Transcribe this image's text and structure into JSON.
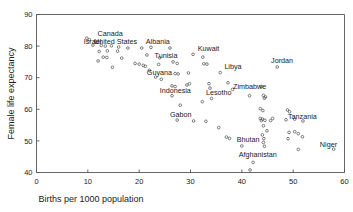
{
  "chart_data": {
    "type": "scatter",
    "title": "",
    "xlabel": "Births per 1000 population",
    "ylabel": "Female life expectancy",
    "xlim": [
      0,
      60
    ],
    "ylim": [
      40,
      90
    ],
    "xticks": [
      0,
      10,
      20,
      30,
      40,
      50,
      60
    ],
    "yticks": [
      40,
      50,
      60,
      70,
      80,
      90
    ],
    "grid": false,
    "legend": "none",
    "marker": "open-circle",
    "marker_color": "#555555",
    "points": [
      {
        "x": 9.8,
        "y": 82.5,
        "label": ""
      },
      {
        "x": 10.3,
        "y": 82.0,
        "label": ""
      },
      {
        "x": 11.5,
        "y": 81.5,
        "label": "Canada"
      },
      {
        "x": 11.0,
        "y": 80.3,
        "label": "Israel"
      },
      {
        "x": 12.6,
        "y": 80.2,
        "label": "United States"
      },
      {
        "x": 13.4,
        "y": 80.0,
        "label": ""
      },
      {
        "x": 14.6,
        "y": 80.1,
        "label": ""
      },
      {
        "x": 16.0,
        "y": 79.7,
        "label": ""
      },
      {
        "x": 17.8,
        "y": 79.4,
        "label": ""
      },
      {
        "x": 12.2,
        "y": 78.3,
        "label": ""
      },
      {
        "x": 13.8,
        "y": 78.5,
        "label": ""
      },
      {
        "x": 15.8,
        "y": 78.4,
        "label": ""
      },
      {
        "x": 12.0,
        "y": 75.3,
        "label": ""
      },
      {
        "x": 13.0,
        "y": 76.5,
        "label": ""
      },
      {
        "x": 13.7,
        "y": 76.4,
        "label": ""
      },
      {
        "x": 16.6,
        "y": 76.2,
        "label": ""
      },
      {
        "x": 14.8,
        "y": 73.3,
        "label": ""
      },
      {
        "x": 19.2,
        "y": 74.5,
        "label": ""
      },
      {
        "x": 20.0,
        "y": 74.3,
        "label": ""
      },
      {
        "x": 20.8,
        "y": 73.9,
        "label": ""
      },
      {
        "x": 21.2,
        "y": 73.6,
        "label": ""
      },
      {
        "x": 20.5,
        "y": 79.4,
        "label": "Albania"
      },
      {
        "x": 22.3,
        "y": 79.6,
        "label": ""
      },
      {
        "x": 21.5,
        "y": 77.2,
        "label": ""
      },
      {
        "x": 23.8,
        "y": 74.2,
        "label": ""
      },
      {
        "x": 24.0,
        "y": 76.3,
        "label": "Tunisia"
      },
      {
        "x": 22.0,
        "y": 72.3,
        "label": ""
      },
      {
        "x": 23.2,
        "y": 70.2,
        "label": "Guyana"
      },
      {
        "x": 24.3,
        "y": 69.5,
        "label": ""
      },
      {
        "x": 26.0,
        "y": 79.4,
        "label": ""
      },
      {
        "x": 26.6,
        "y": 75.0,
        "label": ""
      },
      {
        "x": 27.4,
        "y": 74.5,
        "label": ""
      },
      {
        "x": 27.0,
        "y": 71.3,
        "label": ""
      },
      {
        "x": 27.6,
        "y": 71.2,
        "label": ""
      },
      {
        "x": 26.4,
        "y": 67.4,
        "label": ""
      },
      {
        "x": 27.0,
        "y": 67.2,
        "label": ""
      },
      {
        "x": 26.4,
        "y": 64.3,
        "label": "Indonesia"
      },
      {
        "x": 28.0,
        "y": 61.3,
        "label": ""
      },
      {
        "x": 27.4,
        "y": 56.6,
        "label": "Gabon"
      },
      {
        "x": 29.6,
        "y": 71.5,
        "label": ""
      },
      {
        "x": 29.8,
        "y": 68.1,
        "label": ""
      },
      {
        "x": 29.3,
        "y": 67.7,
        "label": ""
      },
      {
        "x": 30.5,
        "y": 77.4,
        "label": "Kuwait"
      },
      {
        "x": 32.4,
        "y": 76.5,
        "label": ""
      },
      {
        "x": 32.6,
        "y": 74.4,
        "label": ""
      },
      {
        "x": 33.2,
        "y": 74.3,
        "label": ""
      },
      {
        "x": 35.8,
        "y": 71.6,
        "label": "Libya"
      },
      {
        "x": 33.6,
        "y": 68.1,
        "label": ""
      },
      {
        "x": 33.8,
        "y": 66.7,
        "label": ""
      },
      {
        "x": 32.3,
        "y": 62.4,
        "label": "Lesotho"
      },
      {
        "x": 34.1,
        "y": 63.4,
        "label": ""
      },
      {
        "x": 37.3,
        "y": 68.4,
        "label": "Zimbabwe"
      },
      {
        "x": 38.2,
        "y": 66.3,
        "label": ""
      },
      {
        "x": 30.6,
        "y": 56.3,
        "label": ""
      },
      {
        "x": 33.0,
        "y": 56.2,
        "label": ""
      },
      {
        "x": 35.5,
        "y": 54.2,
        "label": ""
      },
      {
        "x": 37.0,
        "y": 51.2,
        "label": ""
      },
      {
        "x": 37.6,
        "y": 50.8,
        "label": ""
      },
      {
        "x": 40.0,
        "y": 48.4,
        "label": "Bhutan"
      },
      {
        "x": 41.6,
        "y": 40.8,
        "label": ""
      },
      {
        "x": 42.2,
        "y": 43.2,
        "label": "Afghanistan"
      },
      {
        "x": 41.5,
        "y": 64.3,
        "label": ""
      },
      {
        "x": 43.8,
        "y": 67.2,
        "label": ""
      },
      {
        "x": 44.2,
        "y": 64.4,
        "label": ""
      },
      {
        "x": 44.6,
        "y": 63.9,
        "label": ""
      },
      {
        "x": 44.4,
        "y": 63.5,
        "label": ""
      },
      {
        "x": 43.6,
        "y": 60.2,
        "label": ""
      },
      {
        "x": 44.1,
        "y": 59.6,
        "label": ""
      },
      {
        "x": 43.6,
        "y": 57.1,
        "label": ""
      },
      {
        "x": 44.0,
        "y": 56.9,
        "label": ""
      },
      {
        "x": 43.8,
        "y": 56.4,
        "label": ""
      },
      {
        "x": 44.5,
        "y": 56.5,
        "label": ""
      },
      {
        "x": 45.6,
        "y": 56.4,
        "label": ""
      },
      {
        "x": 44.2,
        "y": 54.8,
        "label": ""
      },
      {
        "x": 44.9,
        "y": 53.2,
        "label": ""
      },
      {
        "x": 44.0,
        "y": 51.9,
        "label": ""
      },
      {
        "x": 44.3,
        "y": 50.7,
        "label": ""
      },
      {
        "x": 44.2,
        "y": 49.5,
        "label": ""
      },
      {
        "x": 44.4,
        "y": 48.3,
        "label": ""
      },
      {
        "x": 46.9,
        "y": 73.4,
        "label": "Jordan"
      },
      {
        "x": 46.0,
        "y": 57.1,
        "label": ""
      },
      {
        "x": 48.9,
        "y": 59.8,
        "label": ""
      },
      {
        "x": 49.3,
        "y": 59.2,
        "label": ""
      },
      {
        "x": 48.6,
        "y": 56.7,
        "label": "Tanzania"
      },
      {
        "x": 50.3,
        "y": 56.9,
        "label": ""
      },
      {
        "x": 51.9,
        "y": 56.3,
        "label": ""
      },
      {
        "x": 49.2,
        "y": 52.7,
        "label": ""
      },
      {
        "x": 50.3,
        "y": 52.9,
        "label": ""
      },
      {
        "x": 51.0,
        "y": 52.3,
        "label": ""
      },
      {
        "x": 49.0,
        "y": 50.7,
        "label": ""
      },
      {
        "x": 51.8,
        "y": 51.3,
        "label": ""
      },
      {
        "x": 51.0,
        "y": 47.3,
        "label": ""
      },
      {
        "x": 57.9,
        "y": 47.4,
        "label": "Niger"
      }
    ],
    "annotations": [
      {
        "text": "Canada",
        "x": 11.9,
        "y": 83.3
      },
      {
        "text": "Israel",
        "x": 9.2,
        "y": 80.7
      },
      {
        "text": "United States",
        "x": 11.2,
        "y": 80.7
      },
      {
        "text": "Albania",
        "x": 21.3,
        "y": 80.8
      },
      {
        "text": "Tunisia",
        "x": 23.0,
        "y": 76.3
      },
      {
        "text": "Kuwait",
        "x": 31.4,
        "y": 78.3
      },
      {
        "text": "Libya",
        "x": 36.6,
        "y": 72.6
      },
      {
        "text": "Jordan",
        "x": 45.7,
        "y": 74.6
      },
      {
        "text": "Guyana",
        "x": 21.5,
        "y": 70.7
      },
      {
        "text": "Indonesia",
        "x": 24.0,
        "y": 65.3
      },
      {
        "text": "Lesotho",
        "x": 33.0,
        "y": 64.5
      },
      {
        "text": "Zimbabwe",
        "x": 38.3,
        "y": 66.3
      },
      {
        "text": "Gabon",
        "x": 26.0,
        "y": 57.5
      },
      {
        "text": "Tanzania",
        "x": 49.0,
        "y": 56.8
      },
      {
        "text": "Bhutan",
        "x": 39.0,
        "y": 49.7
      },
      {
        "text": "Afghanistan",
        "x": 39.4,
        "y": 44.8
      },
      {
        "text": "Niger",
        "x": 55.2,
        "y": 48.0
      }
    ]
  }
}
